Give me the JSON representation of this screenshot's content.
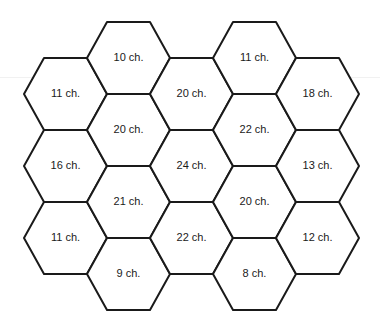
{
  "diagram": {
    "type": "hexagonal-grid",
    "orientation": "flat-top",
    "stroke_color": "#1a1a1a",
    "fill_color": "#ffffff",
    "columns": [
      {
        "index": 0,
        "cells": [
          {
            "label": "11 ch."
          },
          {
            "label": "16 ch."
          },
          {
            "label": "11 ch."
          }
        ]
      },
      {
        "index": 1,
        "cells": [
          {
            "label": "10 ch."
          },
          {
            "label": "20 ch."
          },
          {
            "label": "21 ch."
          },
          {
            "label": "9 ch."
          }
        ]
      },
      {
        "index": 2,
        "cells": [
          {
            "label": "20 ch."
          },
          {
            "label": "24 ch."
          },
          {
            "label": "22 ch."
          }
        ]
      },
      {
        "index": 3,
        "cells": [
          {
            "label": "11 ch."
          },
          {
            "label": "22 ch."
          },
          {
            "label": "20 ch."
          },
          {
            "label": "8 ch."
          }
        ]
      },
      {
        "index": 4,
        "cells": [
          {
            "label": "18 ch."
          },
          {
            "label": "13 ch."
          },
          {
            "label": "12 ch."
          }
        ]
      }
    ]
  }
}
